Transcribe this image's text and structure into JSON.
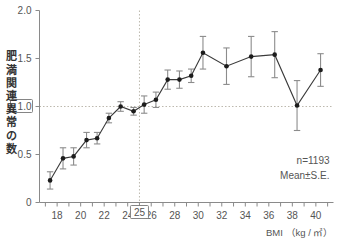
{
  "chart_data": {
    "type": "line",
    "title": "",
    "xlabel": "BMI （kg / ㎡）",
    "ylabel": "肥満関連異常の数",
    "xlim": [
      16.5,
      41.5
    ],
    "ylim": [
      0,
      2.0
    ],
    "ytick_labels": [
      "0",
      "0.5",
      "1.0",
      "1.5",
      "2.0"
    ],
    "ytick_values": [
      0,
      0.5,
      1.0,
      1.5,
      2.0
    ],
    "xtick_labels": [
      "18",
      "20",
      "22",
      "24",
      "26",
      "28",
      "30",
      "32",
      "34",
      "36",
      "38",
      "40"
    ],
    "xtick_values": [
      18,
      20,
      22,
      24,
      26,
      28,
      30,
      32,
      34,
      36,
      38,
      40
    ],
    "xtick_minor_step": 1,
    "grid": false,
    "legend": "none",
    "error_type": "S.E.",
    "reference_lines": [
      {
        "axis": "y",
        "value": 1.0,
        "style": "dashed",
        "label": "1.0",
        "boxed_label": true
      },
      {
        "axis": "x",
        "value": 25,
        "style": "dashed",
        "label": "25",
        "boxed_label": true
      }
    ],
    "x": [
      17.4,
      18.5,
      19.4,
      20.5,
      21.4,
      22.4,
      23.4,
      24.5,
      25.4,
      26.4,
      27.4,
      28.4,
      29.4,
      30.4,
      32.4,
      34.5,
      36.5,
      38.4,
      40.4
    ],
    "series": [
      {
        "name": "肥満関連異常の数",
        "values": [
          0.23,
          0.46,
          0.48,
          0.65,
          0.67,
          0.88,
          1.0,
          0.95,
          1.02,
          1.07,
          1.28,
          1.28,
          1.32,
          1.56,
          1.42,
          1.52,
          1.54,
          1.01,
          1.38
        ],
        "errors": [
          0.09,
          0.11,
          0.09,
          0.08,
          0.06,
          0.05,
          0.05,
          0.04,
          0.09,
          0.08,
          0.1,
          0.09,
          0.07,
          0.17,
          0.19,
          0.21,
          0.24,
          0.26,
          0.17
        ]
      }
    ],
    "annotations": [
      "n=1193",
      "Mean±S.E."
    ]
  },
  "axis": {
    "y_label_chars": [
      "肥",
      "満",
      "関",
      "連",
      "異",
      "常",
      "の",
      "数"
    ],
    "x_axis_title": "BMI （kg / ㎡）"
  },
  "notes": {
    "sample_size": "n=1193",
    "stat": "Mean±S.E."
  },
  "colors": {
    "marker": "#1c1c1c",
    "line": "#3a3a3a",
    "error": "#8c8c8c",
    "axis": "#8a8a8a",
    "guide": "#bdb9ae",
    "text": "#555555",
    "background": "#ffffff"
  }
}
